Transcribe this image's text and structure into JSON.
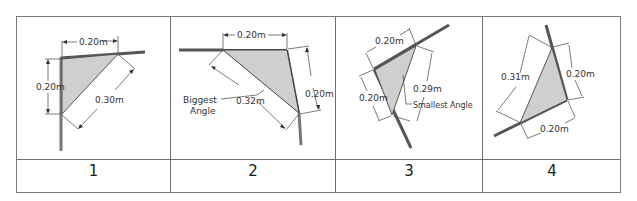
{
  "colors": {
    "border": "#6e6e6e",
    "triangle_fill": "#cfcfcf",
    "wall": "#555555",
    "dim_line": "#444444"
  },
  "panels": [
    {
      "number": "1",
      "labels": {
        "top": "0.20m",
        "left": "0.20m",
        "diag": "0.30m"
      }
    },
    {
      "number": "2",
      "labels": {
        "top": "0.20m",
        "right": "0.20m",
        "diag": "0.32m",
        "note_line1": "Biggest",
        "note_line2": "Angle"
      }
    },
    {
      "number": "3",
      "labels": {
        "top": "0.20m",
        "left": "0.20m",
        "diag": "0.29m",
        "note": "Smallest Angle"
      }
    },
    {
      "number": "4",
      "labels": {
        "right": "0.20m",
        "bottom": "0.20m",
        "diag": "0.31m"
      }
    }
  ]
}
